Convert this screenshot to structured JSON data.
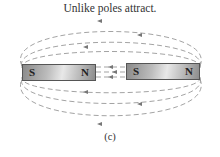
{
  "title": "Unlike poles attract.",
  "caption": "(c)",
  "magnets": [
    {
      "left_pole": "S",
      "right_pole": "N"
    },
    {
      "left_pole": "S",
      "right_pole": "N"
    }
  ],
  "colors": {
    "field_line": "#8a8a8a",
    "magnet": "#a8a8a8",
    "text": "#333333"
  }
}
